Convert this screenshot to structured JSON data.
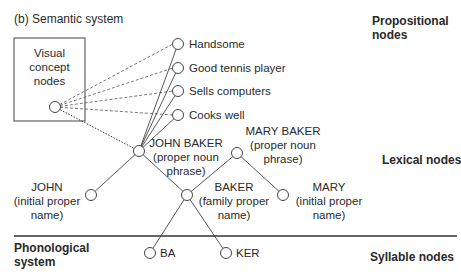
{
  "title": "(b) Semantic system",
  "layers": {
    "propositional": [
      "Propositional",
      "nodes"
    ],
    "lexical": "Lexical nodes",
    "syllable": "Syllable nodes",
    "phonological": [
      "Phonological",
      "system"
    ]
  },
  "visual_box": [
    "Visual",
    "concept",
    "nodes"
  ],
  "propositions": [
    "Handsome",
    "Good tennis player",
    "Sells computers",
    "Cooks well"
  ],
  "lexical": {
    "john_baker": [
      "JOHN BAKER",
      "(proper noun",
      "phrase)"
    ],
    "mary_baker": [
      "MARY BAKER",
      "(proper noun",
      "phrase)"
    ],
    "john": [
      "JOHN",
      "(initial proper",
      "name)"
    ],
    "baker": [
      "BAKER",
      "(family proper",
      "name)"
    ],
    "mary": [
      "MARY",
      "(initial proper",
      "name)"
    ]
  },
  "syllables": [
    "BA",
    "KER"
  ]
}
